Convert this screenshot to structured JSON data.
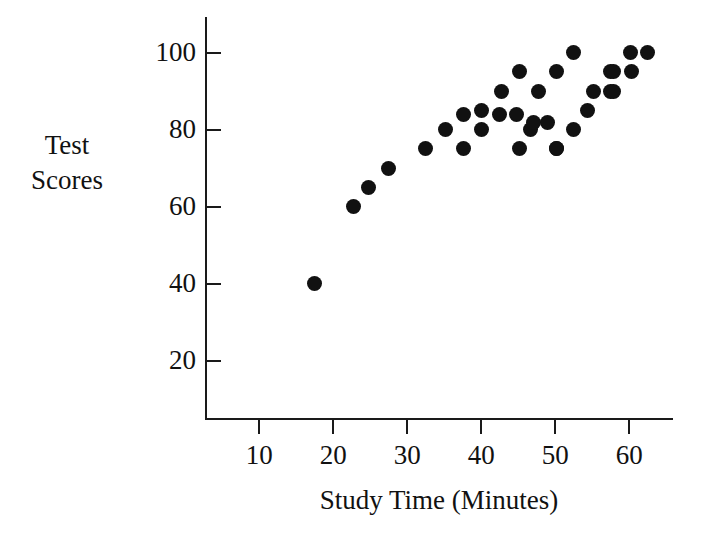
{
  "chart_data": {
    "type": "scatter",
    "title": "",
    "xlabel": "Study Time (Minutes)",
    "ylabel": "Test Scores",
    "ylabel_lines": [
      "Test",
      "Scores"
    ],
    "xlim": [
      0,
      65.8
    ],
    "ylim": [
      0,
      109
    ],
    "xticks": [
      10,
      20,
      30,
      40,
      50,
      60
    ],
    "yticks": [
      20,
      40,
      60,
      80,
      100
    ],
    "xtick_labels": [
      "10",
      "20",
      "30",
      "40",
      "50",
      "60"
    ],
    "ytick_labels": [
      "20",
      "40",
      "60",
      "80",
      "100"
    ],
    "grid": false,
    "legend": null,
    "marker": "filled-circle",
    "marker_color": "#111111",
    "point_count": 33,
    "points": [
      {
        "x": 17.4,
        "y": 40
      },
      {
        "x": 22.7,
        "y": 60
      },
      {
        "x": 24.8,
        "y": 65
      },
      {
        "x": 27.5,
        "y": 70
      },
      {
        "x": 32.5,
        "y": 75
      },
      {
        "x": 35.1,
        "y": 80
      },
      {
        "x": 37.6,
        "y": 84
      },
      {
        "x": 37.6,
        "y": 75
      },
      {
        "x": 40.0,
        "y": 85
      },
      {
        "x": 40.0,
        "y": 80
      },
      {
        "x": 42.4,
        "y": 84
      },
      {
        "x": 42.7,
        "y": 90
      },
      {
        "x": 45.2,
        "y": 95
      },
      {
        "x": 45.1,
        "y": 75
      },
      {
        "x": 46.7,
        "y": 80
      },
      {
        "x": 47.0,
        "y": 82
      },
      {
        "x": 47.7,
        "y": 90
      },
      {
        "x": 50.1,
        "y": 75
      },
      {
        "x": 50.2,
        "y": 95
      },
      {
        "x": 50.2,
        "y": 75
      },
      {
        "x": 52.5,
        "y": 100
      },
      {
        "x": 52.5,
        "y": 80
      },
      {
        "x": 54.3,
        "y": 85
      },
      {
        "x": 55.1,
        "y": 90
      },
      {
        "x": 57.5,
        "y": 95
      },
      {
        "x": 57.5,
        "y": 90
      },
      {
        "x": 57.8,
        "y": 95
      },
      {
        "x": 57.8,
        "y": 90
      },
      {
        "x": 60.2,
        "y": 100
      },
      {
        "x": 60.3,
        "y": 95
      },
      {
        "x": 62.5,
        "y": 100
      },
      {
        "x": 44.7,
        "y": 84
      },
      {
        "x": 49.0,
        "y": 82
      }
    ]
  },
  "colors": {
    "axis": "#1a1a1a",
    "text": "#111111",
    "marker": "#111111",
    "background": "#ffffff"
  }
}
